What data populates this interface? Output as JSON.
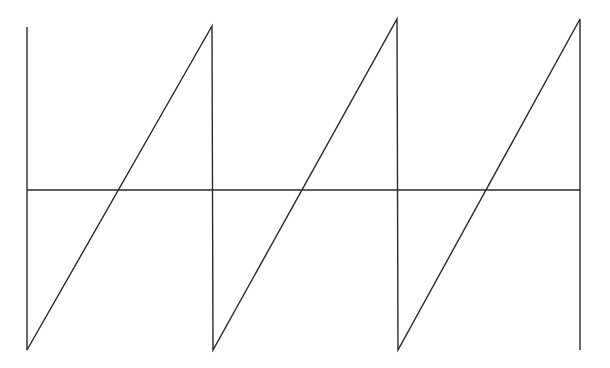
{
  "diagram": {
    "type": "sawtooth-waveform",
    "stroke_color": "#2a2a2a",
    "background": "#ffffff",
    "axis": {
      "y": 190,
      "x_start": 27,
      "x_end": 580
    },
    "left_bound": {
      "x": 27,
      "y_top": 27,
      "y_bottom": 350
    },
    "cycles": [
      {
        "start": [
          27,
          350
        ],
        "peak": [
          212,
          26
        ],
        "drop_to": [
          213,
          350
        ]
      },
      {
        "start": [
          213,
          350
        ],
        "peak": [
          397,
          19
        ],
        "drop_to": [
          398,
          350
        ]
      },
      {
        "start": [
          398,
          350
        ],
        "peak": [
          580,
          19
        ],
        "drop_to": [
          580,
          350
        ]
      }
    ],
    "period_count": 3
  }
}
